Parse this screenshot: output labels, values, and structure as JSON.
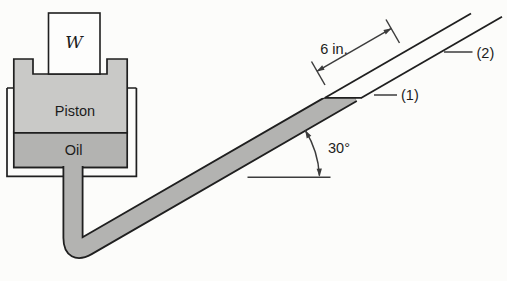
{
  "figure": {
    "kind": "piston-cylinder-inclined-tube-manometer-diagram",
    "labels": {
      "weight": "W",
      "piston": "Piston",
      "oil": "Oil",
      "dimension": "6 in.",
      "angle": "30°",
      "point1": "(1)",
      "point2": "(2)"
    },
    "values": {
      "incline_angle_deg": 30,
      "marked_tube_length": "6 in."
    },
    "colors": {
      "background": "#fcfcfa",
      "piston_fill": "#c9c9c7",
      "oil_fill": "#b3b3b1",
      "weight_fill": "#fdfdfc",
      "outline": "#1f1f1f",
      "annotation": "#3c3c3c",
      "text": "#1c1c1c"
    }
  }
}
